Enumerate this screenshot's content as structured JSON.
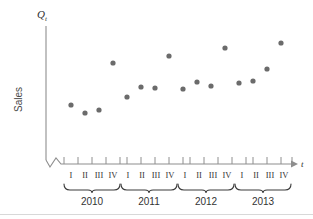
{
  "chart_data": {
    "type": "scatter",
    "title": "",
    "xlabel": "t",
    "ylabel": "Sales",
    "yaxis_symbol": "Q",
    "yaxis_symbol_subscript": "t",
    "grid": false,
    "legend": "none",
    "axis_break": true,
    "categories": [
      "2010 I",
      "2010 II",
      "2010 III",
      "2010 IV",
      "2011 I",
      "2011 II",
      "2011 III",
      "2011 IV",
      "2012 I",
      "2012 II",
      "2012 III",
      "2012 IV",
      "2013 I",
      "2013 II",
      "2013 III",
      "2013 IV"
    ],
    "quarter_labels": [
      "I",
      "II",
      "III",
      "IV"
    ],
    "years": [
      "2010",
      "2011",
      "2012",
      "2013"
    ],
    "values": [
      20,
      14,
      16,
      54,
      28,
      38,
      37,
      63,
      35,
      42,
      39,
      72,
      40,
      43,
      55,
      80
    ],
    "ylim": [
      0,
      100
    ],
    "series": [
      {
        "name": "Sales",
        "values": [
          20,
          14,
          16,
          54,
          28,
          38,
          37,
          63,
          35,
          42,
          39,
          72,
          40,
          43,
          55,
          80
        ]
      }
    ],
    "marker": "circle",
    "marker_color": "#6b6b6b",
    "points": [
      {
        "label": "2010 I",
        "x": 71,
        "y": 105
      },
      {
        "label": "2010 II",
        "x": 85,
        "y": 113
      },
      {
        "label": "2010 III",
        "x": 99,
        "y": 110
      },
      {
        "label": "2010 IV",
        "x": 113,
        "y": 63
      },
      {
        "label": "2011 I",
        "x": 127,
        "y": 97
      },
      {
        "label": "2011 II",
        "x": 141,
        "y": 87
      },
      {
        "label": "2011 III",
        "x": 155,
        "y": 88
      },
      {
        "label": "2011 IV",
        "x": 169,
        "y": 56
      },
      {
        "label": "2012 I",
        "x": 183,
        "y": 89
      },
      {
        "label": "2012 II",
        "x": 197,
        "y": 82
      },
      {
        "label": "2012 III",
        "x": 211,
        "y": 86
      },
      {
        "label": "2012 IV",
        "x": 225,
        "y": 48
      },
      {
        "label": "2013 I",
        "x": 239,
        "y": 83
      },
      {
        "label": "2013 II",
        "x": 253,
        "y": 81
      },
      {
        "label": "2013 III",
        "x": 267,
        "y": 69
      },
      {
        "label": "2013 IV",
        "x": 281,
        "y": 43
      }
    ]
  },
  "axes": {
    "y_axis_symbol": "Q",
    "y_axis_subscript": "t",
    "y_axis_title": "Sales",
    "x_axis_symbol": "t"
  },
  "ticks": {
    "x_positions": [
      64,
      78,
      92,
      106,
      120,
      127,
      141,
      155,
      169,
      183,
      190,
      204,
      218,
      232,
      246,
      253,
      267,
      281,
      292
    ],
    "quarter_label_positions": [
      {
        "label": "I",
        "x": 71
      },
      {
        "label": "II",
        "x": 85
      },
      {
        "label": "III",
        "x": 99
      },
      {
        "label": "IV",
        "x": 113
      },
      {
        "label": "I",
        "x": 128
      },
      {
        "label": "II",
        "x": 142
      },
      {
        "label": "III",
        "x": 156
      },
      {
        "label": "IV",
        "x": 170
      },
      {
        "label": "I",
        "x": 185
      },
      {
        "label": "II",
        "x": 199
      },
      {
        "label": "III",
        "x": 213
      },
      {
        "label": "IV",
        "x": 227
      },
      {
        "label": "I",
        "x": 242
      },
      {
        "label": "II",
        "x": 256
      },
      {
        "label": "III",
        "x": 270
      },
      {
        "label": "IV",
        "x": 284
      }
    ],
    "year_groups": [
      {
        "label": "2010",
        "start": 64,
        "end": 120,
        "center": 92
      },
      {
        "label": "2011",
        "start": 121,
        "end": 177,
        "center": 149
      },
      {
        "label": "2012",
        "start": 178,
        "end": 234,
        "center": 206
      },
      {
        "label": "2013",
        "start": 235,
        "end": 291,
        "center": 263
      }
    ]
  }
}
